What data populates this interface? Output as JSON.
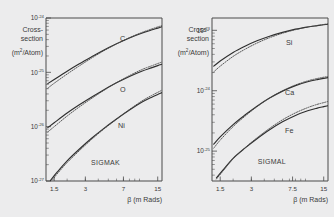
{
  "figure": {
    "background": "#ececed",
    "ink": "#2e2e2e"
  },
  "chart_data": [
    {
      "type": "line",
      "id": "sigmak",
      "title": "SIGMAK",
      "xlabel": "β (m Rads)",
      "ylabel_lines": [
        "Cross-",
        "section",
        "(m²/Atom)"
      ],
      "ylabel": "Cross-section (m²/Atom)",
      "xscale": "log",
      "yscale": "log",
      "xlim": [
        1.25,
        16.5
      ],
      "ylim": [
        1e-27,
        1e-24
      ],
      "xticks": [
        1.5,
        3,
        7,
        15
      ],
      "xticklabels": [
        "1.5",
        "3",
        "7",
        "15"
      ],
      "yticks": [
        1e-24,
        1e-25,
        1e-26,
        1e-27
      ],
      "yticklabels": [
        "10⁻²⁴",
        "10⁻²⁵",
        "10⁻²⁶",
        "10⁻²⁷"
      ],
      "ytick_mantissa": "10",
      "ytick_exponents": [
        "-24",
        "-25",
        "-26",
        "-27"
      ],
      "grid": false,
      "legend": "inline-curve-labels",
      "series": [
        {
          "name": "C",
          "style": "solid",
          "label": "C",
          "x": [
            1.3,
            1.5,
            2.0,
            2.6,
            3.4,
            4.5,
            6.0,
            8.0,
            10.5,
            13.0,
            15.0,
            16.5
          ],
          "y": [
            6.2e-26,
            7.4e-26,
            1.05e-25,
            1.42e-25,
            1.9e-25,
            2.55e-25,
            3.35e-25,
            4.3e-25,
            5.25e-25,
            6e-25,
            6.5e-25,
            6.9e-25
          ]
        },
        {
          "name": "C-dotted",
          "style": "dotted",
          "label": "",
          "x": [
            1.3,
            1.5,
            2.0,
            2.6,
            3.4,
            4.5,
            6.0,
            8.0,
            10.5,
            13.0,
            15.0,
            16.5
          ],
          "y": [
            5.1e-26,
            6.3e-26,
            9.3e-26,
            1.3e-25,
            1.8e-25,
            2.48e-25,
            3.32e-25,
            4.35e-25,
            5.4e-25,
            6.25e-25,
            6.85e-25,
            7.25e-25
          ]
        },
        {
          "name": "O",
          "style": "solid",
          "label": "O",
          "x": [
            1.3,
            1.5,
            2.0,
            2.6,
            3.4,
            4.5,
            6.0,
            8.0,
            10.5,
            13.0,
            15.0,
            16.5
          ],
          "y": [
            9.6e-27,
            1.18e-26,
            1.78e-26,
            2.5e-26,
            3.45e-26,
            4.75e-26,
            6.4e-26,
            8.4e-26,
            1.05e-25,
            1.21e-25,
            1.33e-25,
            1.41e-25
          ]
        },
        {
          "name": "O-dotted",
          "style": "dotted",
          "label": "",
          "x": [
            1.3,
            1.5,
            2.0,
            2.6,
            3.4,
            4.5,
            6.0,
            8.0,
            10.5,
            13.0,
            15.0,
            16.5
          ],
          "y": [
            8e-27,
            1e-26,
            1.57e-26,
            2.28e-26,
            3.25e-26,
            4.62e-26,
            6.45e-26,
            8.7e-26,
            1.12e-25,
            1.31e-25,
            1.45e-25,
            1.55e-25
          ]
        },
        {
          "name": "Ni",
          "style": "solid",
          "label": "Ni",
          "x": [
            1.38,
            1.6,
            2.0,
            2.6,
            3.4,
            4.5,
            6.0,
            8.0,
            10.5,
            13.0,
            15.0,
            16.5
          ],
          "y": [
            1.02e-27,
            1.45e-27,
            2.35e-27,
            3.8e-27,
            6e-27,
            9.2e-27,
            1.38e-26,
            2.02e-26,
            2.8e-26,
            3.45e-26,
            3.92e-26,
            4.25e-26
          ]
        },
        {
          "name": "Ni-dotted",
          "style": "dotted",
          "label": "",
          "x": [
            1.45,
            1.6,
            2.0,
            2.6,
            3.4,
            4.5,
            6.0,
            8.0,
            10.5,
            13.0,
            15.0,
            16.5
          ],
          "y": [
            1.05e-27,
            1.35e-27,
            2.18e-27,
            3.55e-27,
            5.7e-27,
            8.95e-27,
            1.37e-26,
            2.07e-26,
            2.95e-26,
            3.72e-26,
            4.28e-26,
            4.7e-26
          ]
        }
      ]
    },
    {
      "type": "line",
      "id": "sigmal",
      "title": "SIGMAL",
      "xlabel": "β (m Rads)",
      "ylabel_lines": [
        "Cross-",
        "section",
        "(m²/Atom)"
      ],
      "ylabel": "Cross-section (m²/Atom)",
      "xscale": "log",
      "yscale": "log",
      "xlim": [
        1.25,
        16.5
      ],
      "ylim": [
        3.2e-26,
        1.6e-23
      ],
      "xticks": [
        1.5,
        3,
        7.5,
        15
      ],
      "xticklabels": [
        "1.5",
        "3",
        "7.5",
        "15"
      ],
      "yticks": [
        1e-23,
        1e-24,
        1e-25
      ],
      "yticklabels": [
        "10⁻²³",
        "10⁻²⁴",
        "10⁻²⁵"
      ],
      "ytick_mantissa": "10",
      "ytick_exponents": [
        "-23",
        "-24",
        "-25"
      ],
      "grid": false,
      "legend": "inline-curve-labels",
      "series": [
        {
          "name": "Si",
          "style": "solid",
          "label": "Si",
          "x": [
            1.3,
            1.5,
            2.0,
            2.6,
            3.4,
            4.5,
            6.0,
            8.0,
            10.5,
            13.0,
            15.0,
            16.5
          ],
          "y": [
            2.55e-24,
            3.1e-24,
            4.3e-24,
            5.45e-24,
            6.7e-24,
            8e-24,
            9.25e-24,
            1.045e-23,
            1.135e-23,
            1.195e-23,
            1.235e-23,
            1.26e-23
          ]
        },
        {
          "name": "Si-dotted",
          "style": "dotted",
          "label": "",
          "x": [
            1.3,
            1.5,
            2.0,
            2.6,
            3.4,
            4.5,
            6.0,
            8.0,
            10.5,
            13.0,
            15.0,
            16.5
          ],
          "y": [
            2.05e-24,
            2.55e-24,
            3.7e-24,
            4.85e-24,
            6.15e-24,
            7.55e-24,
            8.95e-24,
            1.025e-23,
            1.135e-23,
            1.205e-23,
            1.25e-23,
            1.285e-23
          ]
        },
        {
          "name": "Ca",
          "style": "solid",
          "label": "Ca",
          "x": [
            1.3,
            1.5,
            2.0,
            2.6,
            3.4,
            4.5,
            6.0,
            8.0,
            10.5,
            13.0,
            15.0,
            16.5
          ],
          "y": [
            1.3e-25,
            1.72e-25,
            2.75e-25,
            3.95e-25,
            5.55e-25,
            7.55e-25,
            9.85e-25,
            1.215e-24,
            1.405e-24,
            1.53e-24,
            1.6e-24,
            1.645e-24
          ]
        },
        {
          "name": "Ca-dotted",
          "style": "dotted",
          "label": "",
          "x": [
            1.3,
            1.5,
            2.0,
            2.6,
            3.4,
            4.5,
            6.0,
            8.0,
            10.5,
            13.0,
            15.0,
            16.5
          ],
          "y": [
            1.12e-25,
            1.52e-25,
            2.55e-25,
            3.78e-25,
            5.45e-25,
            7.55e-25,
            9.95e-25,
            1.245e-24,
            1.455e-24,
            1.595e-24,
            1.675e-24,
            1.725e-24
          ]
        },
        {
          "name": "Fe",
          "style": "solid",
          "label": "Fe",
          "x": [
            1.38,
            1.6,
            2.0,
            2.6,
            3.4,
            4.5,
            6.0,
            8.0,
            10.5,
            13.0,
            15.0,
            16.5
          ],
          "y": [
            3.6e-26,
            4.9e-26,
            7.6e-26,
            1.12e-25,
            1.6e-25,
            2.25e-25,
            3.05e-25,
            3.9e-25,
            4.65e-25,
            5.15e-25,
            5.45e-25,
            5.65e-25
          ]
        },
        {
          "name": "Fe-dotted",
          "style": "dotted",
          "label": "",
          "x": [
            1.38,
            1.6,
            2.0,
            2.6,
            3.4,
            4.5,
            6.0,
            8.0,
            10.5,
            13.0,
            15.0,
            16.5
          ],
          "y": [
            3.45e-26,
            4.7e-26,
            7.45e-26,
            1.13e-25,
            1.66e-25,
            2.38e-25,
            3.3e-25,
            4.3e-25,
            5.25e-25,
            5.95e-25,
            6.35e-25,
            6.65e-25
          ]
        }
      ]
    }
  ]
}
